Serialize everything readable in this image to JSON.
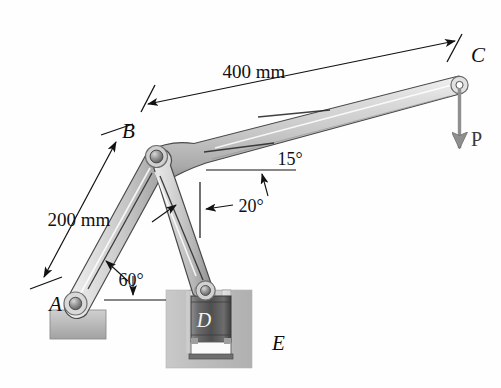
{
  "figure": {
    "background_color": "#ffffff",
    "width": 501,
    "height": 388
  },
  "labels": {
    "point_a": "A",
    "point_b": "B",
    "point_c": "C",
    "point_d": "D",
    "point_e": "E",
    "force_p": "P"
  },
  "dimensions": [
    {
      "id": "dim-bc",
      "text": "400 mm",
      "from": "B",
      "to": "C"
    },
    {
      "id": "dim-ab",
      "text": "200 mm",
      "from": "A",
      "to": "B"
    }
  ],
  "angles": [
    {
      "id": "angle-ab",
      "text": "60°",
      "reference": "horizontal",
      "member": "AB"
    },
    {
      "id": "angle-bd",
      "text": "20°",
      "reference": "vertical",
      "member": "BD"
    },
    {
      "id": "angle-bc",
      "text": "15°",
      "reference": "horizontal",
      "member": "BC"
    }
  ],
  "colors": {
    "link_light": "#e2e2e2",
    "link_mid": "#c2c2c2",
    "link_dark": "#9a9a9a",
    "outline": "#4a4a4a",
    "piston_dark": "#5a5a5a",
    "block_gray": "#b8b8b8",
    "arrow": "#8a8a8a",
    "ink": "#111111"
  },
  "members": {
    "arm_bc": "400 mm arm from B to C inclined 15 degrees above horizontal",
    "arm_ab": "200 mm arm from A to B inclined 60 degrees above horizontal",
    "rod_bd": "connecting rod from B to piston D inclined 20 degrees from vertical"
  }
}
